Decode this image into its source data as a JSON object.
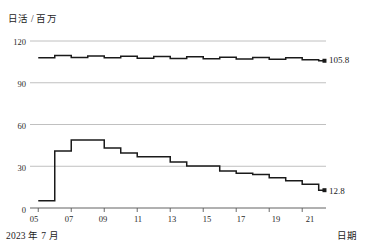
{
  "chart_data": {
    "type": "line",
    "subtype": "step",
    "title": "",
    "ylabel": "日活 / 百万",
    "xlabel": "日期",
    "x_period_label": "2023 年 7 月",
    "ylim": [
      0,
      120
    ],
    "y_ticks": [
      0,
      30,
      60,
      90,
      120
    ],
    "y_tick_labels": [
      "0",
      "30",
      "60",
      "90",
      "120"
    ],
    "grid": true,
    "grid_axis": "y",
    "xlim": [
      4.5,
      22.2
    ],
    "x_ticks": [
      5,
      7,
      9,
      11,
      13,
      15,
      17,
      19,
      21
    ],
    "x_tick_labels": [
      "05",
      "07",
      "09",
      "11",
      "13",
      "15",
      "17",
      "19",
      "21"
    ],
    "legend": "none",
    "x": [
      5,
      6,
      7,
      8,
      9,
      10,
      11,
      12,
      13,
      14,
      15,
      16,
      17,
      18,
      19,
      20,
      21,
      22
    ],
    "series": [
      {
        "name": "上方曲线",
        "color": "#1a1a1a",
        "end_label": "105.8",
        "end_value": 105.8,
        "values": [
          108.0,
          109.6,
          108.2,
          109.3,
          107.9,
          109.1,
          107.6,
          108.8,
          107.4,
          108.6,
          107.2,
          108.4,
          107.0,
          108.2,
          106.8,
          108.0,
          106.5,
          105.8
        ]
      },
      {
        "name": "下方曲线",
        "color": "#1a1a1a",
        "end_label": "12.8",
        "end_value": 12.8,
        "values": [
          5.2,
          41.0,
          48.8,
          48.8,
          43.2,
          39.6,
          36.8,
          36.8,
          33.0,
          30.2,
          30.2,
          26.5,
          25.0,
          24.0,
          21.8,
          19.6,
          17.0,
          12.8
        ]
      }
    ]
  }
}
